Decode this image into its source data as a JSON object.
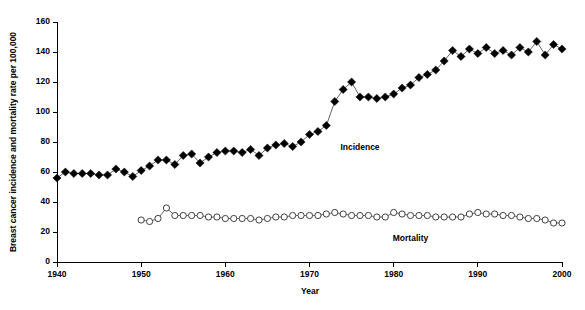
{
  "chart_data": {
    "type": "line",
    "title": "",
    "xlabel": "Year",
    "ylabel": "Breast cancer incidence and mortality rate per 100,000",
    "xlim": [
      1940,
      2000
    ],
    "ylim": [
      0,
      160
    ],
    "xticks": [
      1940,
      1950,
      1960,
      1970,
      1980,
      1990,
      2000
    ],
    "yticks": [
      0,
      20,
      40,
      60,
      80,
      100,
      120,
      140,
      160
    ],
    "grid": false,
    "legend_position": "inline-annotation",
    "series": [
      {
        "name": "Incidence",
        "marker": "filled-diamond",
        "color": "#000000",
        "label_x": 1976,
        "label_y": 75,
        "x": [
          1940,
          1941,
          1942,
          1943,
          1944,
          1945,
          1946,
          1947,
          1948,
          1949,
          1950,
          1951,
          1952,
          1953,
          1954,
          1955,
          1956,
          1957,
          1958,
          1959,
          1960,
          1961,
          1962,
          1963,
          1964,
          1965,
          1966,
          1967,
          1968,
          1969,
          1970,
          1971,
          1972,
          1973,
          1974,
          1975,
          1976,
          1977,
          1978,
          1979,
          1980,
          1981,
          1982,
          1983,
          1984,
          1985,
          1986,
          1987,
          1988,
          1989,
          1990,
          1991,
          1992,
          1993,
          1994,
          1995,
          1996,
          1997,
          1998,
          1999,
          2000
        ],
        "y": [
          56,
          60,
          59,
          59,
          59,
          58,
          58,
          62,
          60,
          57,
          61,
          64,
          68,
          68,
          65,
          71,
          72,
          66,
          70,
          73,
          74,
          74,
          73,
          75,
          71,
          76,
          78,
          79,
          77,
          80,
          85,
          87,
          91,
          107,
          115,
          120,
          110,
          110,
          109,
          110,
          112,
          116,
          118,
          123,
          125,
          128,
          134,
          141,
          137,
          142,
          139,
          143,
          139,
          141,
          138,
          143,
          140,
          147,
          138,
          145,
          142
        ]
      },
      {
        "name": "Mortality",
        "marker": "open-circle",
        "color": "#404040",
        "label_x": 1982,
        "label_y": 14,
        "x": [
          1950,
          1951,
          1952,
          1953,
          1954,
          1955,
          1956,
          1957,
          1958,
          1959,
          1960,
          1961,
          1962,
          1963,
          1964,
          1965,
          1966,
          1967,
          1968,
          1969,
          1970,
          1971,
          1972,
          1973,
          1974,
          1975,
          1976,
          1977,
          1978,
          1979,
          1980,
          1981,
          1982,
          1983,
          1984,
          1985,
          1986,
          1987,
          1988,
          1989,
          1990,
          1991,
          1992,
          1993,
          1994,
          1995,
          1996,
          1997,
          1998,
          1999,
          2000
        ],
        "y": [
          28,
          27,
          29,
          36,
          31,
          31,
          31,
          31,
          30,
          30,
          29,
          29,
          29,
          29,
          28,
          29,
          30,
          30,
          31,
          31,
          31,
          31,
          32,
          33,
          32,
          31,
          31,
          31,
          30,
          30,
          33,
          32,
          31,
          31,
          31,
          30,
          30,
          30,
          30,
          32,
          33,
          32,
          32,
          31,
          31,
          30,
          29,
          29,
          28,
          26,
          26
        ]
      }
    ]
  }
}
